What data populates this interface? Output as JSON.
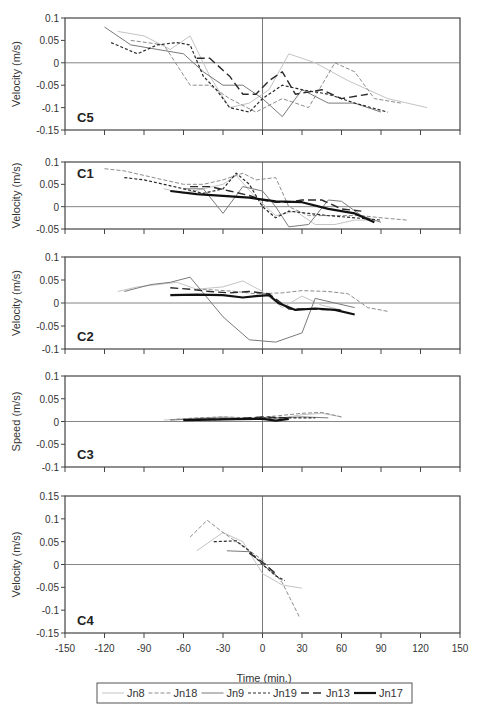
{
  "chart_data": {
    "type": "line",
    "title": "",
    "xlabel": "Time (min.)",
    "xlim": [
      -150,
      150
    ],
    "xticks": [
      -150,
      -120,
      -90,
      -60,
      -30,
      0,
      30,
      60,
      90,
      120,
      150
    ],
    "legend": {
      "position": "bottom",
      "entries": [
        {
          "name": "Jn8",
          "style": "thin-light-solid",
          "color": "#bdbdbd"
        },
        {
          "name": "Jn18",
          "style": "thin-dashed",
          "color": "#8a8a8a"
        },
        {
          "name": "Jn9",
          "style": "thin-solid",
          "color": "#7a7a7a"
        },
        {
          "name": "Jn19",
          "style": "short-dash",
          "color": "#333333"
        },
        {
          "name": "Jn13",
          "style": "long-dash",
          "color": "#333333"
        },
        {
          "name": "Jn17",
          "style": "thick-solid",
          "color": "#111111"
        }
      ]
    },
    "panels": [
      {
        "label": "C5",
        "ylabel": "Velocity (m/s)",
        "ylim": [
          -0.15,
          0.1
        ],
        "yticks": [
          0.1,
          0.05,
          0,
          -0.05,
          -0.1,
          -0.15
        ],
        "series": [
          {
            "name": "Jn8",
            "x": [
              -110,
              -90,
              -70,
              -55,
              -40,
              -25,
              -10,
              5,
              20,
              40,
              65,
              95,
              125
            ],
            "y": [
              0.07,
              0.06,
              0.03,
              0.06,
              -0.03,
              -0.1,
              -0.09,
              -0.06,
              0.02,
              0.0,
              -0.04,
              -0.08,
              -0.1
            ]
          },
          {
            "name": "Jn18",
            "x": [
              -100,
              -75,
              -55,
              -40,
              -25,
              -5,
              15,
              35,
              55,
              70,
              85,
              105
            ],
            "y": [
              0.05,
              0.04,
              -0.05,
              -0.05,
              -0.08,
              -0.11,
              -0.08,
              -0.1,
              0.0,
              -0.02,
              -0.08,
              -0.09
            ]
          },
          {
            "name": "Jn9",
            "x": [
              -120,
              -100,
              -80,
              -60,
              -45,
              -30,
              -15,
              0,
              15,
              30,
              50,
              70,
              90
            ],
            "y": [
              0.08,
              0.04,
              0.03,
              0.02,
              -0.02,
              -0.05,
              -0.05,
              -0.08,
              -0.12,
              -0.06,
              -0.09,
              -0.09,
              -0.11
            ]
          },
          {
            "name": "Jn19",
            "x": [
              -115,
              -95,
              -80,
              -65,
              -55,
              -45,
              -35,
              -25,
              -10,
              0,
              15,
              30,
              50,
              70,
              95
            ],
            "y": [
              0.045,
              0.02,
              0.04,
              0.045,
              0.04,
              -0.03,
              -0.06,
              -0.1,
              -0.11,
              -0.08,
              -0.05,
              -0.06,
              -0.07,
              -0.09,
              -0.11
            ]
          },
          {
            "name": "Jn13",
            "x": [
              -50,
              -40,
              -25,
              -15,
              -5,
              5,
              15,
              25,
              45,
              60,
              80
            ],
            "y": [
              0.01,
              0.01,
              -0.03,
              -0.07,
              -0.07,
              -0.04,
              -0.02,
              -0.07,
              -0.06,
              -0.08,
              -0.07
            ]
          }
        ]
      },
      {
        "label": "C1",
        "ylabel": "Velocity (m/s)",
        "ylim": [
          -0.05,
          0.1
        ],
        "yticks": [
          0.1,
          0.05,
          0,
          -0.05
        ],
        "series": [
          {
            "name": "Jn8",
            "x": [
              -75,
              -60,
              -45,
              -30,
              -20,
              -5,
              10,
              25,
              40,
              55,
              70,
              85
            ],
            "y": [
              0.04,
              0.03,
              0.04,
              0.05,
              0.07,
              0.02,
              -0.02,
              -0.01,
              -0.04,
              -0.04,
              -0.03,
              -0.03
            ]
          },
          {
            "name": "Jn18",
            "x": [
              -120,
              -105,
              -90,
              -75,
              -60,
              -45,
              -30,
              -15,
              -5,
              10,
              20,
              35,
              55,
              75,
              90,
              110
            ],
            "y": [
              0.085,
              0.08,
              0.07,
              0.06,
              0.05,
              0.05,
              0.06,
              0.075,
              0.06,
              0.065,
              0.0,
              -0.02,
              -0.02,
              -0.02,
              -0.025,
              -0.03
            ]
          },
          {
            "name": "Jn9",
            "x": [
              -60,
              -45,
              -30,
              -15,
              0,
              10,
              20,
              35,
              50,
              60,
              75,
              90
            ],
            "y": [
              0.04,
              0.04,
              -0.015,
              0.045,
              0.035,
              0.0,
              -0.045,
              -0.04,
              0.015,
              0.012,
              -0.02,
              -0.035
            ]
          },
          {
            "name": "Jn19",
            "x": [
              -105,
              -90,
              -75,
              -60,
              -45,
              -30,
              -20,
              -10,
              0,
              10,
              20,
              35,
              50,
              70,
              90
            ],
            "y": [
              0.065,
              0.06,
              0.05,
              0.04,
              0.03,
              0.04,
              0.075,
              0.05,
              0.0,
              -0.025,
              -0.01,
              -0.015,
              -0.02,
              -0.025,
              -0.03
            ]
          },
          {
            "name": "Jn13",
            "x": [
              -55,
              -40,
              -25,
              -10,
              0,
              10,
              20,
              30,
              45,
              60,
              75
            ],
            "y": [
              0.045,
              0.045,
              0.035,
              0.025,
              0.015,
              0.01,
              0.01,
              0.015,
              0.015,
              -0.005,
              -0.01
            ]
          },
          {
            "name": "Jn17",
            "x": [
              -70,
              -50,
              -30,
              -10,
              10,
              30,
              50,
              70,
              85
            ],
            "y": [
              0.035,
              0.028,
              0.024,
              0.02,
              0.012,
              0.01,
              -0.005,
              -0.015,
              -0.035
            ]
          }
        ]
      },
      {
        "label": "C2",
        "ylabel": "Velocity (m/s)",
        "ylim": [
          -0.1,
          0.1
        ],
        "yticks": [
          0.1,
          0.05,
          0,
          -0.05,
          -0.1
        ],
        "series": [
          {
            "name": "Jn8",
            "x": [
              -110,
              -95,
              -80,
              -65,
              -50,
              -30,
              -15,
              0,
              15,
              30,
              45,
              60
            ],
            "y": [
              0.025,
              0.035,
              0.04,
              0.045,
              0.03,
              0.035,
              0.048,
              0.025,
              -0.01,
              0.015,
              -0.005,
              -0.015
            ]
          },
          {
            "name": "Jn18",
            "x": [
              -50,
              -35,
              -20,
              -5,
              15,
              30,
              50,
              65,
              80,
              95
            ],
            "y": [
              0.03,
              0.028,
              0.025,
              0.02,
              0.022,
              0.027,
              0.025,
              0.02,
              -0.01,
              -0.018
            ]
          },
          {
            "name": "Jn9",
            "x": [
              -105,
              -85,
              -70,
              -55,
              -30,
              -10,
              10,
              30,
              40,
              55,
              70
            ],
            "y": [
              0.025,
              0.04,
              0.045,
              0.056,
              -0.03,
              -0.08,
              -0.085,
              -0.065,
              0.01,
              0.0,
              -0.01
            ]
          },
          {
            "name": "Jn13",
            "x": [
              -70,
              -55,
              -40,
              -25,
              -10,
              5,
              20,
              30,
              60
            ],
            "y": [
              0.033,
              0.03,
              0.025,
              0.022,
              0.025,
              0.02,
              -0.013,
              -0.013,
              -0.015
            ]
          },
          {
            "name": "Jn17",
            "x": [
              -70,
              -50,
              -30,
              -15,
              -5,
              5,
              12,
              25,
              40,
              55,
              70
            ],
            "y": [
              0.017,
              0.018,
              0.017,
              0.012,
              0.015,
              0.017,
              0.0,
              -0.015,
              -0.012,
              -0.015,
              -0.025
            ]
          }
        ]
      },
      {
        "label": "C3",
        "ylabel": "Speed (m/s)",
        "ylim": [
          -0.1,
          0.1
        ],
        "yticks": [
          0.1,
          0.05,
          0,
          -0.05,
          -0.1
        ],
        "series": [
          {
            "name": "Jn8",
            "x": [
              -75,
              -60,
              -45,
              -30,
              -15,
              0,
              15,
              30,
              45,
              60
            ],
            "y": [
              0.003,
              0.006,
              0.008,
              0.01,
              0.008,
              0.005,
              0.008,
              0.015,
              0.018,
              0.01
            ]
          },
          {
            "name": "Jn18",
            "x": [
              -70,
              -50,
              -30,
              -10,
              10,
              30,
              45,
              60
            ],
            "y": [
              0.004,
              0.008,
              0.01,
              0.008,
              0.012,
              0.018,
              0.02,
              0.01
            ]
          },
          {
            "name": "Jn9",
            "x": [
              -70,
              -50,
              -30,
              -10,
              10,
              30,
              50
            ],
            "y": [
              0.003,
              0.006,
              0.008,
              0.006,
              0.008,
              0.01,
              0.008
            ]
          },
          {
            "name": "Jn19",
            "x": [
              -60,
              -40,
              -20,
              0,
              20,
              40
            ],
            "y": [
              0.003,
              0.004,
              0.005,
              0.008,
              0.008,
              0.008
            ]
          },
          {
            "name": "Jn13",
            "x": [
              -60,
              -40,
              -20,
              0,
              20
            ],
            "y": [
              0.004,
              0.005,
              0.006,
              0.01,
              0.008
            ]
          },
          {
            "name": "Jn17",
            "x": [
              -60,
              -40,
              -20,
              0,
              10,
              20
            ],
            "y": [
              0.003,
              0.004,
              0.005,
              0.006,
              0.002,
              0.006
            ]
          }
        ]
      },
      {
        "label": "C4",
        "ylabel": "Velocity (m/s)",
        "ylim": [
          -0.15,
          0.15
        ],
        "yticks": [
          0.15,
          0.1,
          0.05,
          0,
          -0.05,
          -0.1,
          -0.15
        ],
        "series": [
          {
            "name": "Jn8",
            "x": [
              -50,
              -30,
              -15,
              0,
              15,
              30
            ],
            "y": [
              0.03,
              0.07,
              0.05,
              -0.02,
              -0.045,
              -0.052
            ]
          },
          {
            "name": "Jn18",
            "x": [
              -55,
              -42,
              -30,
              -15,
              0,
              15,
              28
            ],
            "y": [
              0.06,
              0.097,
              0.07,
              0.04,
              0.01,
              -0.04,
              -0.115
            ]
          },
          {
            "name": "Jn9",
            "x": [
              -27,
              -10,
              0,
              15
            ],
            "y": [
              0.03,
              0.028,
              0.0,
              -0.035
            ]
          },
          {
            "name": "Jn19",
            "x": [
              -37,
              -20,
              -10,
              0,
              10,
              17
            ],
            "y": [
              0.05,
              0.052,
              0.03,
              0.0,
              -0.025,
              -0.035
            ]
          },
          {
            "name": "Jn13",
            "x": [
              -10,
              0,
              10
            ],
            "y": [
              0.025,
              0.005,
              -0.02
            ]
          }
        ]
      }
    ]
  }
}
